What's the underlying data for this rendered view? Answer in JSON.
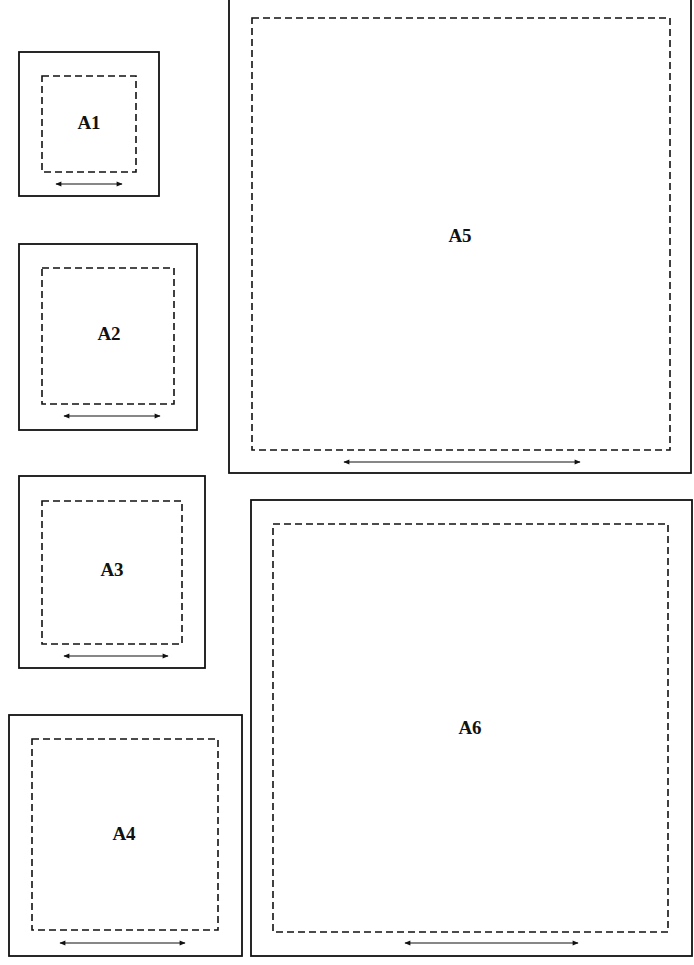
{
  "diagram": {
    "panels": [
      {
        "id": "A1",
        "label": "A1"
      },
      {
        "id": "A2",
        "label": "A2"
      },
      {
        "id": "A3",
        "label": "A3"
      },
      {
        "id": "A4",
        "label": "A4"
      },
      {
        "id": "A5",
        "label": "A5"
      },
      {
        "id": "A6",
        "label": "A6"
      }
    ],
    "legend": {
      "outer_border": "solid",
      "inner_border": "dashed",
      "width_marker": "double-headed-arrow"
    }
  }
}
